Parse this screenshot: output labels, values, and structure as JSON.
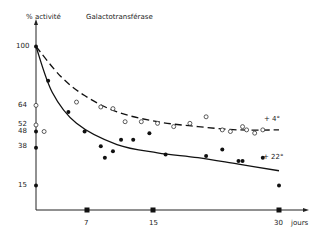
{
  "chart_data": {
    "type": "scatter",
    "title": "Galactotransférase",
    "ylabel": "% activité",
    "xlabel": "jours",
    "y_ticks": [
      100,
      64,
      52,
      48,
      38,
      15
    ],
    "x_ticks": [
      7,
      15,
      30
    ],
    "ylim": [
      0,
      110
    ],
    "xlim": [
      0,
      32
    ],
    "grid": false,
    "legend": "inline labels at curve ends",
    "series": [
      {
        "name": "+ 4°",
        "marker": "open-circle",
        "fit_line": "dashed",
        "points": [
          [
            0,
            64
          ],
          [
            0,
            52
          ],
          [
            1,
            48
          ],
          [
            5,
            66
          ],
          [
            8,
            63
          ],
          [
            9.5,
            62
          ],
          [
            11,
            54
          ],
          [
            13,
            54
          ],
          [
            15,
            53
          ],
          [
            17,
            51
          ],
          [
            19,
            53
          ],
          [
            21,
            57
          ],
          [
            23,
            49
          ],
          [
            24,
            48
          ],
          [
            25.5,
            51
          ],
          [
            26,
            49
          ],
          [
            27,
            47
          ],
          [
            28,
            49
          ]
        ],
        "fit": [
          [
            0,
            100
          ],
          [
            3,
            82
          ],
          [
            6,
            70
          ],
          [
            10,
            60
          ],
          [
            15,
            54
          ],
          [
            20,
            51
          ],
          [
            25,
            49
          ],
          [
            30,
            49
          ]
        ]
      },
      {
        "name": "+ 22°",
        "marker": "filled-circle",
        "fit_line": "solid",
        "points": [
          [
            0,
            100
          ],
          [
            0,
            48
          ],
          [
            0,
            38
          ],
          [
            0,
            15
          ],
          [
            1.5,
            79
          ],
          [
            4,
            60
          ],
          [
            6,
            48
          ],
          [
            8,
            39
          ],
          [
            8.5,
            32
          ],
          [
            9.5,
            36
          ],
          [
            10.5,
            43
          ],
          [
            12,
            43
          ],
          [
            14,
            47
          ],
          [
            16,
            34
          ],
          [
            21,
            33
          ],
          [
            23,
            37
          ],
          [
            25,
            30
          ],
          [
            25.5,
            30
          ],
          [
            28,
            32
          ],
          [
            30,
            15
          ]
        ],
        "fit": [
          [
            0,
            100
          ],
          [
            2,
            72
          ],
          [
            5,
            53
          ],
          [
            10,
            40
          ],
          [
            15,
            35
          ],
          [
            20,
            32
          ],
          [
            25,
            28
          ],
          [
            30,
            24
          ]
        ]
      }
    ],
    "x_axis_markers": [
      7,
      15,
      30
    ],
    "annotations": [
      "+ 4°",
      "+ 22°"
    ]
  },
  "labels": {
    "title": "Galactotransférase",
    "ylabel": "% activité",
    "xlabel": "jours",
    "y100": "100",
    "y64": "64",
    "y52": "52",
    "y48": "48",
    "y38": "38",
    "y15": "15",
    "x7": "7",
    "x15": "15",
    "x30": "30",
    "series4": "+ 4°",
    "series22": "+ 22°"
  }
}
